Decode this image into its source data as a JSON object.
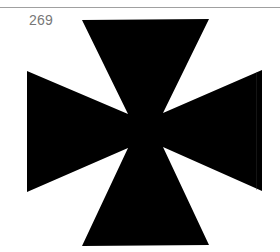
{
  "page": {
    "number": "269"
  },
  "figure": {
    "shape": "cross-pattee-icon",
    "fill_color": "#000000",
    "background_color": "#ffffff",
    "rule_color": "#a0a0a0",
    "points": "82,20 209,19 163,113 262,70 262,191 163,147 209,245 82,246 128,148 27,192 27,71 128,114"
  }
}
